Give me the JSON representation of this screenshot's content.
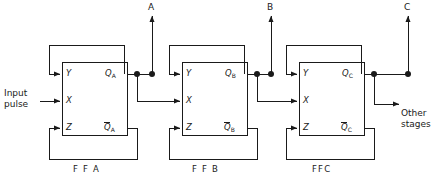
{
  "diagram": {
    "type": "logic-circuit-schematic",
    "line_color": "#1a1a1a",
    "background": "#ffffff"
  },
  "input": {
    "label_line1": "Input",
    "label_line2": "pulse"
  },
  "side_note": {
    "line1": "Other",
    "line2": "stages"
  },
  "outputs": [
    {
      "id": "A",
      "label": "A",
      "x": 152,
      "source": "FFA"
    },
    {
      "id": "B",
      "label": "B",
      "x": 271,
      "source": "FFB"
    },
    {
      "id": "C",
      "label": "C",
      "x": 408,
      "source": "FFC"
    }
  ],
  "flipflops": [
    {
      "name": "FFA",
      "name_label": "F F A",
      "inputs": [
        {
          "label": "Y"
        },
        {
          "label": "X"
        },
        {
          "label": "Z"
        }
      ],
      "outputs": [
        {
          "label": "Q",
          "sub": "A",
          "inverted": false
        },
        {
          "label": "Q",
          "sub": "A",
          "inverted": true
        }
      ]
    },
    {
      "name": "FFB",
      "name_label": "F F B",
      "inputs": [
        {
          "label": "Y"
        },
        {
          "label": "X"
        },
        {
          "label": "Z"
        }
      ],
      "outputs": [
        {
          "label": "Q",
          "sub": "B",
          "inverted": false
        },
        {
          "label": "Q",
          "sub": "B",
          "inverted": true
        }
      ]
    },
    {
      "name": "FFC",
      "name_label": "FFC",
      "inputs": [
        {
          "label": "Y"
        },
        {
          "label": "X"
        },
        {
          "label": "Z"
        }
      ],
      "outputs": [
        {
          "label": "Q",
          "sub": "C",
          "inverted": false
        },
        {
          "label": "Q",
          "sub": "C",
          "inverted": true
        }
      ]
    }
  ]
}
